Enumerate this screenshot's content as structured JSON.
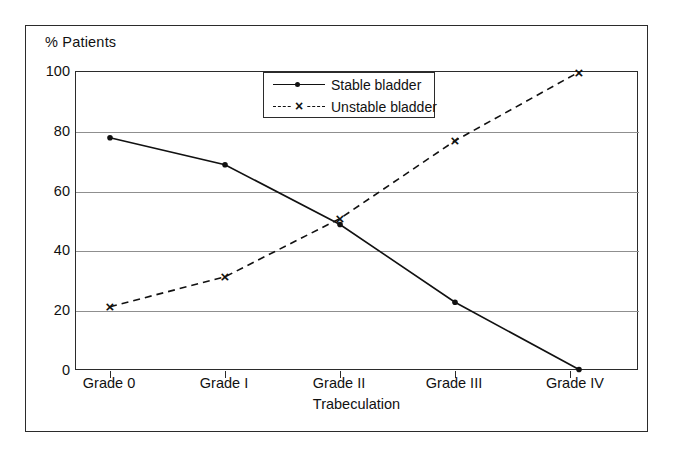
{
  "chart_data": {
    "type": "line",
    "title": "",
    "ylabel": "% Patients",
    "xlabel": "Trabeculation",
    "categories": [
      "Grade 0",
      "Grade I",
      "Grade II",
      "Grade III",
      "Grade IV"
    ],
    "ylim": [
      0,
      100
    ],
    "yticks": [
      0,
      20,
      40,
      60,
      80,
      100
    ],
    "ytick_labels": [
      "0",
      "20",
      "40",
      "60",
      "80",
      "100"
    ],
    "grid": true,
    "legend_position": "top-center",
    "series": [
      {
        "name": "Stable bladder",
        "marker": "dot",
        "linestyle": "solid",
        "color": "#111111",
        "values": [
          78,
          69,
          49,
          23,
          0.5
        ]
      },
      {
        "name": "Unstable bladder",
        "marker": "x",
        "linestyle": "dashed",
        "color": "#111111",
        "values": [
          21.5,
          31.5,
          51,
          77,
          100
        ]
      }
    ]
  },
  "legend": {
    "items": [
      {
        "label": "Stable bladder"
      },
      {
        "label": "Unstable bladder"
      }
    ]
  }
}
